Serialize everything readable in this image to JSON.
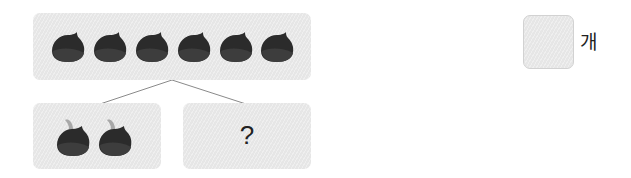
{
  "problem": {
    "total_group": {
      "count": 6,
      "item": "chestnut",
      "icon": "chestnut-icon"
    },
    "known_part": {
      "count": 2,
      "item": "chestnut-with-stem",
      "icon": "chestnut-stem-icon"
    },
    "unknown_part": {
      "label": "?"
    },
    "answer": {
      "value": "",
      "unit": "개"
    }
  },
  "colors": {
    "box_fill": "#e6e6e6",
    "chestnut_dark": "#2b2b2b",
    "chestnut_mid": "#3d3d3d",
    "stem": "#a8a8a8",
    "connector_line": "#8a8a8a",
    "text": "#222222"
  }
}
